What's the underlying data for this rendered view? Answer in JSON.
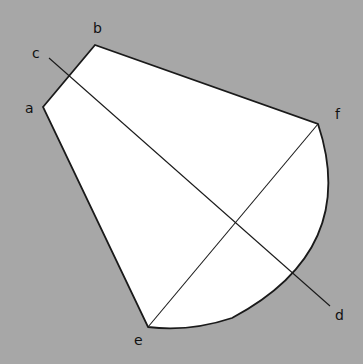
{
  "diagram": {
    "background": "#a7a7a7",
    "shape_fill": "#ffffff",
    "stroke": "#1a1a1a",
    "labels": {
      "a": "a",
      "b": "b",
      "c": "c",
      "d": "d",
      "e": "e",
      "f": "f"
    },
    "points": {
      "a": [
        43,
        107
      ],
      "b": [
        95,
        45
      ],
      "f": [
        318,
        124
      ],
      "e": [
        148,
        327
      ],
      "c_line_start": [
        49,
        58
      ],
      "d_line_end": [
        330,
        306
      ]
    },
    "lines": [
      "c-d",
      "e-f"
    ]
  }
}
